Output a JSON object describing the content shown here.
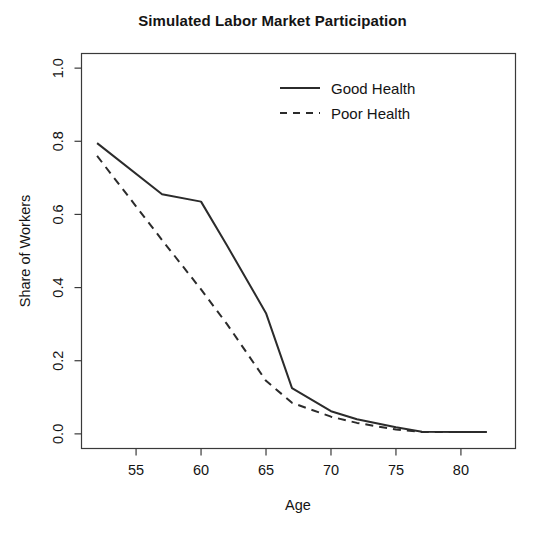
{
  "chart_data": {
    "type": "line",
    "title": "Simulated Labor Market Participation",
    "xlabel": "Age",
    "ylabel": "Share of Workers",
    "xlim": [
      50.8,
      84.2
    ],
    "ylim": [
      -0.04,
      1.04
    ],
    "xticks": [
      55,
      60,
      65,
      70,
      75,
      80
    ],
    "xtick_labels": [
      "55",
      "60",
      "65",
      "70",
      "75",
      "80"
    ],
    "yticks": [
      0.0,
      0.2,
      0.4,
      0.6,
      0.8,
      1.0
    ],
    "ytick_labels": [
      "0.0",
      "0.2",
      "0.4",
      "0.6",
      "0.8",
      "1.0"
    ],
    "grid": false,
    "legend_position": "top-center-right",
    "x": [
      52,
      57,
      60,
      62,
      65,
      67,
      70,
      72,
      75,
      77,
      80,
      82
    ],
    "series": [
      {
        "name": "Good Health",
        "style": "solid",
        "color": "#2b2b2b",
        "values": [
          0.795,
          0.655,
          0.635,
          0.515,
          0.33,
          0.125,
          0.062,
          0.04,
          0.018,
          0.006,
          0.005,
          0.005
        ]
      },
      {
        "name": "Poor Health",
        "style": "dashed",
        "color": "#2b2b2b",
        "values": [
          0.76,
          0.53,
          0.395,
          0.3,
          0.145,
          0.085,
          0.047,
          0.03,
          0.012,
          0.005,
          0.005,
          0.005
        ]
      }
    ]
  },
  "legend": {
    "entries": [
      {
        "label": "Good Health",
        "style": "solid"
      },
      {
        "label": "Poor Health",
        "style": "dashed"
      }
    ]
  }
}
